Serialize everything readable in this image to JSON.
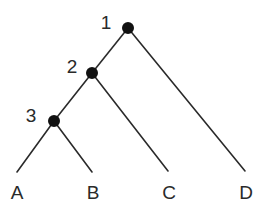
{
  "diagram": {
    "type": "cladogram",
    "stroke_color": "#2a2a2a",
    "node_color": "#111111",
    "nodes": [
      {
        "id": "1",
        "label": "1",
        "x": 128,
        "y": 28,
        "label_x": 106,
        "label_y": 22
      },
      {
        "id": "2",
        "label": "2",
        "x": 92,
        "y": 73,
        "label_x": 72,
        "label_y": 66
      },
      {
        "id": "3",
        "label": "3",
        "x": 54,
        "y": 121,
        "label_x": 31,
        "label_y": 115
      }
    ],
    "leaves": [
      {
        "id": "A",
        "label": "A",
        "x": 17,
        "y": 172,
        "label_x": 17,
        "label_y": 192
      },
      {
        "id": "B",
        "label": "B",
        "x": 92,
        "y": 172,
        "label_x": 93,
        "label_y": 192
      },
      {
        "id": "C",
        "label": "C",
        "x": 168,
        "y": 171,
        "label_x": 169,
        "label_y": 192
      },
      {
        "id": "D",
        "label": "D",
        "x": 245,
        "y": 171,
        "label_x": 246,
        "label_y": 192
      }
    ],
    "edges": [
      {
        "from": "1",
        "to": "2"
      },
      {
        "from": "1",
        "to": "D"
      },
      {
        "from": "2",
        "to": "3"
      },
      {
        "from": "2",
        "to": "C"
      },
      {
        "from": "3",
        "to": "A"
      },
      {
        "from": "3",
        "to": "B"
      }
    ]
  }
}
